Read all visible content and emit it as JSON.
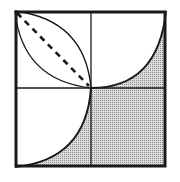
{
  "diagram": {
    "colors": {
      "background": "#ffffff",
      "stroke": "#1a1a1a",
      "shade": "#c8c8c8",
      "shade_dot": "#8a8a8a"
    },
    "box": {
      "x": 15,
      "y": 11,
      "size_w": 151,
      "size_h": 156
    },
    "center": {
      "x": 91,
      "y": 88
    },
    "elements": [
      {
        "type": "outer-square"
      },
      {
        "type": "vertical-midline"
      },
      {
        "type": "horizontal-midline"
      },
      {
        "type": "lens-arc-upper",
        "quadrant": "top-left"
      },
      {
        "type": "lens-arc-lower",
        "quadrant": "top-left"
      },
      {
        "type": "dashed-diagonal",
        "quadrant": "top-left"
      },
      {
        "type": "quarter-arc-shaded",
        "quadrant": "top-right"
      },
      {
        "type": "quarter-arc-shaded",
        "quadrant": "bottom-left"
      },
      {
        "type": "full-shaded",
        "quadrant": "bottom-right"
      }
    ]
  }
}
